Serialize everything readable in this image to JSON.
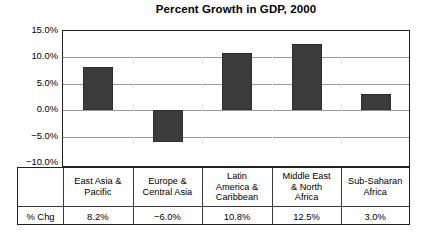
{
  "chart_data": {
    "type": "bar",
    "title": "Percent Growth in GDP, 2000",
    "xlabel": "",
    "ylabel": "",
    "categories": [
      "East Asia & Pacific",
      "Europe & Central Asia",
      "Latin America & Caribbean",
      "Middle East & North Africa",
      "Sub-Saharan Africa"
    ],
    "values": [
      8.2,
      -6.0,
      10.8,
      12.5,
      3.0
    ],
    "value_labels": [
      "8.2%",
      "−6.0%",
      "10.8%",
      "12.5%",
      "3.0%"
    ],
    "ylim": [
      -10.0,
      15.0
    ],
    "ytick_values": [
      15.0,
      10.0,
      5.0,
      0.0,
      -5.0,
      -10.0
    ],
    "ytick_labels": [
      "15.0%",
      "10.0%",
      "5.0%",
      "0.0%",
      "−5.0%",
      "−10.0%"
    ],
    "grid": true,
    "legend": "none",
    "bar_color": "#3b3b3b",
    "gridline_color": "#9a9a9a",
    "axis_color": "#222222"
  },
  "table": {
    "row_header": "% Chg",
    "category_labels": [
      "East Asia &\nPacific",
      "Europe &\nCentral Asia",
      "Latin\nAmerica &\nCaribbean",
      "Middle East\n& North\nAfrica",
      "Sub-Saharan\nAfrica"
    ],
    "value_labels": [
      "8.2%",
      "−6.0%",
      "10.8%",
      "12.5%",
      "3.0%"
    ]
  }
}
